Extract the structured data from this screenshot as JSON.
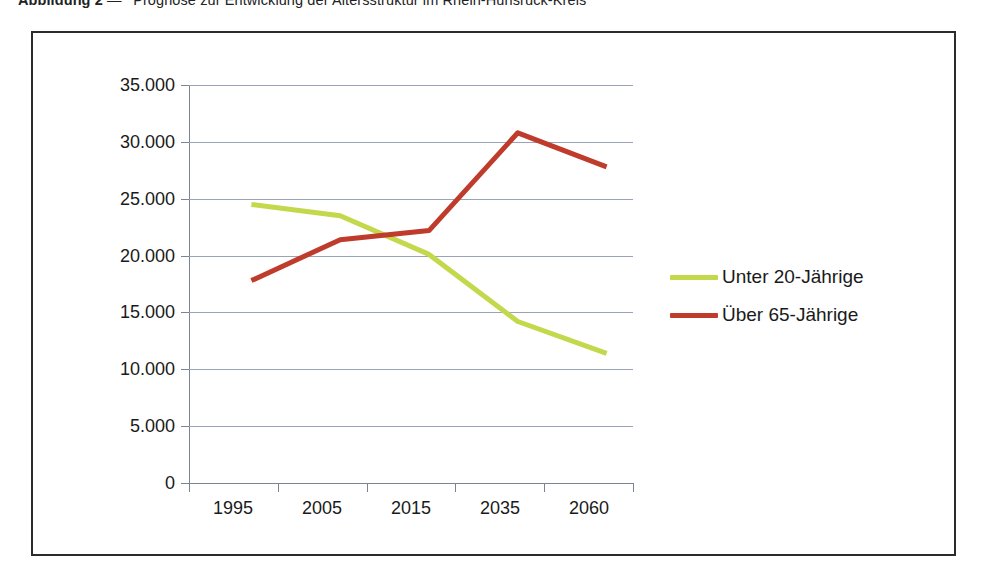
{
  "caption": {
    "number": "Abbildung 2",
    "dash": "—",
    "text": "Prognose zur Entwicklung der Altersstruktur im Rhein-Hunsrück-Kreis"
  },
  "colors": {
    "series_green": "#c3d84b",
    "series_red": "#bf3b2c",
    "gridline": "#9aa3b5",
    "axis": "#7b8494",
    "frame": "#2b2b2b",
    "text": "#1a1a1a"
  },
  "legend": {
    "position": "right",
    "items": [
      {
        "label": "Unter 20-Jährige",
        "color": "#c3d84b"
      },
      {
        "label": "Über 65-Jährige",
        "color": "#bf3b2c"
      }
    ]
  },
  "axes": {
    "y_ticks": [
      "35.000",
      "30.000",
      "25.000",
      "20.000",
      "15.000",
      "10.000",
      "5.000",
      "0"
    ],
    "x_ticks": [
      "1995",
      "2005",
      "2015",
      "2035",
      "2060"
    ]
  },
  "chart_data": {
    "type": "line",
    "title": "Prognose zur Entwicklung der Altersstruktur im Rhein-Hunsrück-Kreis",
    "xlabel": "",
    "ylabel": "",
    "categories": [
      "1995",
      "2005",
      "2015",
      "2035",
      "2060"
    ],
    "series": [
      {
        "name": "Unter 20-Jährige",
        "color": "#c3d84b",
        "values": [
          24500,
          23500,
          20100,
          14200,
          11400
        ]
      },
      {
        "name": "Über 65-Jährige",
        "color": "#bf3b2c",
        "values": [
          17800,
          21400,
          22200,
          30800,
          27800
        ]
      }
    ],
    "ylim": [
      0,
      35000
    ],
    "ytick_values": [
      0,
      5000,
      10000,
      15000,
      20000,
      25000,
      30000,
      35000
    ],
    "grid": "horizontal",
    "legend_position": "right"
  }
}
